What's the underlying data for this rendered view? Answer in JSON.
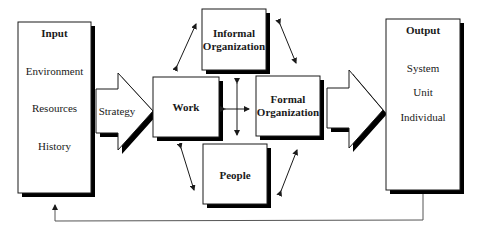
{
  "diagram": {
    "input": {
      "title": "Input",
      "items": [
        "Environment",
        "Resources",
        "History"
      ]
    },
    "strategy_arrow": {
      "label": "Strategy"
    },
    "center": {
      "work": {
        "label": "Work"
      },
      "informal_organization": {
        "line1": "Informal",
        "line2": "Organization"
      },
      "formal_organization": {
        "line1": "Formal",
        "line2": "Organization"
      },
      "people": {
        "label": "People"
      }
    },
    "output": {
      "title": "Output",
      "items": [
        "System",
        "Unit",
        "Individual"
      ]
    },
    "feedback": {
      "label": ""
    }
  },
  "colors": {
    "stroke": "#1a1a1a",
    "fill": "#ffffff",
    "shadow": "#000000",
    "feedback_line": "#555555"
  }
}
